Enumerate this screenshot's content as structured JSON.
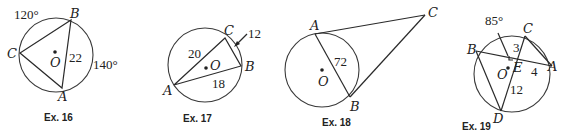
{
  "figures": [
    {
      "caption": "Ex. 16",
      "center_label": "O",
      "points": {
        "A": "A",
        "B": "B",
        "C": "C"
      },
      "arc_labels": [
        "120°",
        "140°"
      ],
      "segment_labels": [
        "22"
      ]
    },
    {
      "caption": "Ex. 17",
      "center_label": "O",
      "points": {
        "A": "A",
        "B": "B",
        "C": "C"
      },
      "segment_labels": [
        "20",
        "18",
        "12"
      ]
    },
    {
      "caption": "Ex. 18",
      "center_label": "O",
      "points": {
        "A": "A",
        "B": "B",
        "C": "C"
      },
      "segment_labels": [
        "72"
      ]
    },
    {
      "caption": "Ex. 19",
      "center_label": "O",
      "points": {
        "A": "A",
        "B": "B",
        "C": "C",
        "D": "D",
        "E": "E"
      },
      "arc_labels": [
        "85°"
      ],
      "segment_labels": [
        "3",
        "4",
        "12"
      ]
    }
  ]
}
